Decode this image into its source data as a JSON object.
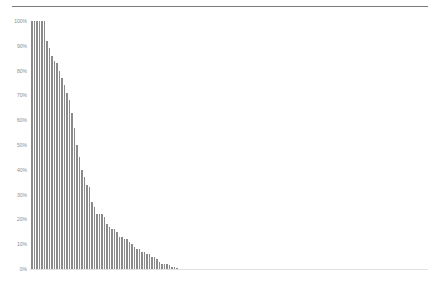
{
  "chart_data": {
    "type": "bar",
    "title": "",
    "xlabel": "",
    "ylabel": "",
    "ylim": [
      0,
      100
    ],
    "y_ticks": [
      "0%",
      "10%",
      "20%",
      "30%",
      "40%",
      "50%",
      "60%",
      "70%",
      "80%",
      "90%",
      "100%"
    ],
    "grid": false,
    "legend": null,
    "bar_color": "#8a8a8a",
    "x_count": 160,
    "values": [
      100,
      100,
      100,
      100,
      100,
      100,
      92,
      89,
      86,
      84,
      83,
      80,
      77,
      74,
      71,
      68,
      63,
      57,
      50,
      45,
      40,
      37,
      34,
      33,
      27,
      25,
      22,
      22,
      22,
      21,
      18,
      17,
      16,
      16,
      15,
      13,
      13,
      12,
      12,
      11,
      10,
      9,
      8,
      8,
      7,
      7,
      6,
      6,
      5,
      5,
      4,
      3,
      2,
      2,
      2,
      1.5,
      1,
      1,
      0.5,
      0,
      0,
      0,
      0,
      0
    ]
  },
  "axis": {
    "ticks": [
      {
        "label": "100%",
        "value": 100
      },
      {
        "label": "90%",
        "value": 90
      },
      {
        "label": "80%",
        "value": 80
      },
      {
        "label": "70%",
        "value": 70
      },
      {
        "label": "60%",
        "value": 60
      },
      {
        "label": "50%",
        "value": 50
      },
      {
        "label": "40%",
        "value": 40
      },
      {
        "label": "30%",
        "value": 30
      },
      {
        "label": "20%",
        "value": 20
      },
      {
        "label": "10%",
        "value": 10
      },
      {
        "label": "0%",
        "value": 0
      }
    ]
  }
}
